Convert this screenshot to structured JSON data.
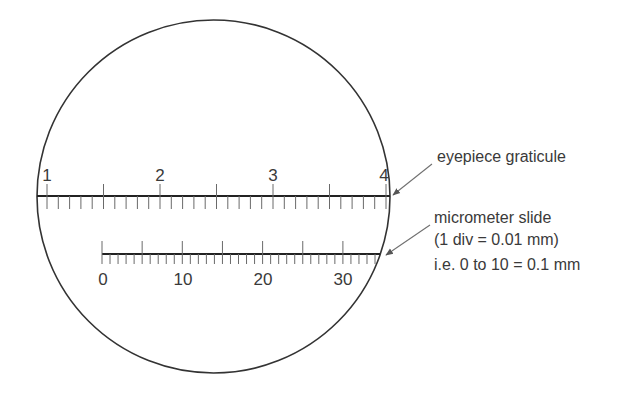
{
  "diagram": {
    "colors": {
      "line": "#2b2b2b",
      "tick": "#6a6a6a",
      "text": "#3a3a3a",
      "arrow": "#707070",
      "background": "#ffffff"
    },
    "field_of_view": {
      "cx": 213.5,
      "cy": 196.5,
      "r": 176.5
    },
    "eyepiece_graticule": {
      "labels": [
        "1",
        "2",
        "3",
        "4"
      ],
      "label_values": [
        1,
        2,
        3,
        4
      ],
      "line_y": 196,
      "x_start": 37,
      "x_end": 390,
      "unit_px": 113,
      "first_label_x": 47,
      "minor_divisions_per_unit": 10
    },
    "micrometer_slide": {
      "labels": [
        "0",
        "10",
        "20",
        "30"
      ],
      "label_values": [
        0,
        10,
        20,
        30
      ],
      "line_y": 254,
      "x_start": 102,
      "x_end": 380,
      "division_px": 8.03,
      "major_every": 5
    },
    "annotations": {
      "graticule_label": "eyepiece graticule",
      "slide_label_line1": "micrometer slide",
      "slide_label_line2": "(1 div = 0.01 mm)",
      "slide_label_line3": "i.e. 0 to 10 = 0.1 mm"
    }
  }
}
